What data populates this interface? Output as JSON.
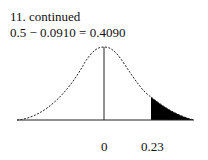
{
  "problem": {
    "heading": "11.  continued",
    "equation": "0.5 − 0.0910 = 0.4090"
  },
  "figure": {
    "type": "normal-curve",
    "shaded_region": "right tail beyond z = 0.23",
    "labels": {
      "center": "0",
      "z_value": "0.23"
    }
  }
}
